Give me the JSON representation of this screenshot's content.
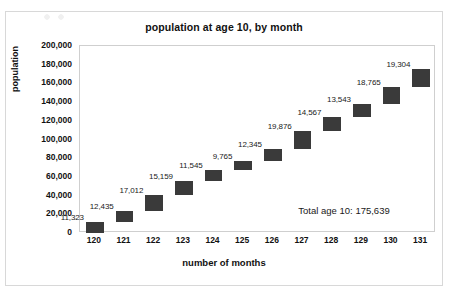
{
  "chart_data": {
    "type": "bar",
    "subtype": "waterfall",
    "title": "population at age 10, by month",
    "xlabel": "number of months",
    "ylabel": "population",
    "categories": [
      "120",
      "121",
      "122",
      "123",
      "124",
      "125",
      "126",
      "127",
      "128",
      "129",
      "130",
      "131"
    ],
    "values": [
      11323,
      12435,
      17012,
      15159,
      11545,
      9765,
      12345,
      19876,
      14567,
      13543,
      18765,
      19304
    ],
    "value_labels": [
      "11,323",
      "12,435",
      "17,012",
      "15,159",
      "11,545",
      "9,765",
      "12,345",
      "19,876",
      "14,567",
      "13,543",
      "18,765",
      "19,304"
    ],
    "cumulative_starts": [
      0,
      11323,
      23758,
      40770,
      55929,
      67474,
      77239,
      89584,
      109460,
      124027,
      137570,
      156335
    ],
    "ylim": [
      0,
      200000
    ],
    "ytick_step": 20000,
    "ytick_labels": [
      "200,000",
      "180,000",
      "160,000",
      "140,000",
      "120,000",
      "100,000",
      "80,000",
      "60,000",
      "40,000",
      "20,000",
      "0"
    ],
    "ytick_values": [
      200000,
      180000,
      160000,
      140000,
      120000,
      100000,
      80000,
      60000,
      40000,
      20000,
      0
    ],
    "grid": false,
    "legend": "none",
    "bar_color": "#3a3a3a",
    "plot_background": "#ffffff",
    "annotations": [
      {
        "name": "total-annotation",
        "text": "Total age 10: 175,639",
        "x_value": 128.4,
        "y_value": 25000
      }
    ]
  }
}
